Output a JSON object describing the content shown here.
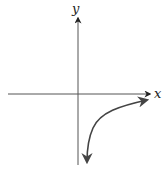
{
  "diagram": {
    "type": "function-graph-sketch",
    "axes": {
      "x_label": "x",
      "y_label": "y",
      "origin_px": [
        78,
        94
      ],
      "color": "#333333"
    },
    "curve": {
      "description": "Decreasing-concavity curve in fourth quadrant approaching x-axis to the right and y-axis downward (e.g. logarithmic-type)",
      "quadrant": "IV",
      "color": "#444444",
      "arrows": [
        "right",
        "down"
      ]
    }
  }
}
